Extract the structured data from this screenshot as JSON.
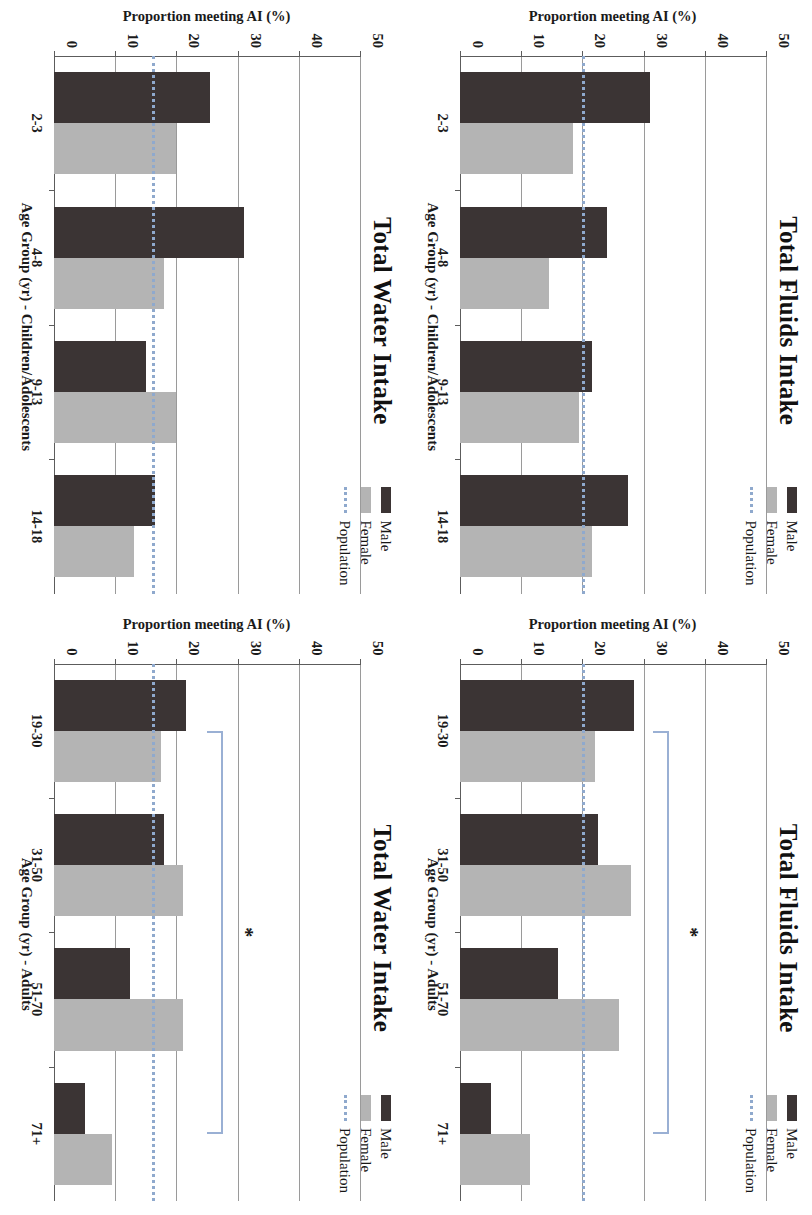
{
  "figure": {
    "orientation": "rotated-90-clockwise",
    "colors": {
      "male": "#3b3434",
      "female": "#b4b4b4",
      "population_line": "#8fa9cd",
      "bracket": "#9ab0d4",
      "gridline": "#9a9a9a",
      "axis": "#5c5c5c"
    },
    "legend": {
      "male_label": "Male",
      "female_label": "Female",
      "population_label": "Population"
    },
    "y_axis": {
      "label": "Proportion meeting AI (%)",
      "ticks": [
        "0",
        "10",
        "20",
        "30",
        "40",
        "50"
      ],
      "min": 0,
      "max": 50
    },
    "significance_marker": "*"
  },
  "panels": [
    {
      "id": "total-fluids-children",
      "title": "Total Fluids Intake",
      "xlabel": "Age Group (yr) - Children/Adolescents",
      "has_significance": false
    },
    {
      "id": "total-fluids-adults",
      "title": "Total Fluids Intake",
      "xlabel": "Age Group (yr) - Adults",
      "has_significance": true
    },
    {
      "id": "total-water-children",
      "title": "Total Water Intake",
      "xlabel": "Age Group (yr) - Children/Adolescents",
      "has_significance": false
    },
    {
      "id": "total-water-adults",
      "title": "Total Water Intake",
      "xlabel": "Age Group (yr) - Adults",
      "has_significance": true
    }
  ],
  "chart_data": [
    {
      "type": "bar",
      "id": "total-fluids-children",
      "title": "Total Fluids Intake",
      "xlabel": "Age Group (yr) - Children/Adolescents",
      "ylabel": "Proportion meeting AI (%)",
      "ylim": [
        0,
        50
      ],
      "yticks": [
        0,
        10,
        20,
        30,
        40,
        50
      ],
      "grid": true,
      "legend_position": "top-right",
      "categories": [
        "2-3",
        "4-8",
        "9-13",
        "14-18"
      ],
      "series": [
        {
          "name": "Male",
          "values": [
            31.0,
            24.0,
            21.5,
            27.5
          ]
        },
        {
          "name": "Female",
          "values": [
            18.5,
            14.5,
            19.5,
            21.5
          ]
        }
      ],
      "reference_line": {
        "name": "Population",
        "value": 20.0,
        "style": "dotted"
      }
    },
    {
      "type": "bar",
      "id": "total-fluids-adults",
      "title": "Total Fluids Intake",
      "xlabel": "Age Group (yr) - Adults",
      "ylabel": "Proportion meeting AI (%)",
      "ylim": [
        0,
        50
      ],
      "yticks": [
        0,
        10,
        20,
        30,
        40,
        50
      ],
      "grid": true,
      "legend_position": "top-right",
      "categories": [
        "19-30",
        "31-50",
        "51-70",
        "71+"
      ],
      "series": [
        {
          "name": "Male",
          "values": [
            28.5,
            22.5,
            16.0,
            5.0
          ]
        },
        {
          "name": "Female",
          "values": [
            22.0,
            28.0,
            26.0,
            11.5
          ]
        }
      ],
      "reference_line": {
        "name": "Population",
        "value": 20.0,
        "style": "dotted"
      },
      "annotations": [
        {
          "type": "significance-bracket",
          "label": "*",
          "from": "19-30",
          "to": "71+",
          "level": 31.5
        }
      ]
    },
    {
      "type": "bar",
      "id": "total-water-children",
      "title": "Total Water Intake",
      "xlabel": "Age Group (yr) - Children/Adolescents",
      "ylabel": "Proportion meeting AI (%)",
      "ylim": [
        0,
        50
      ],
      "yticks": [
        0,
        10,
        20,
        30,
        40,
        50
      ],
      "grid": true,
      "legend_position": "top-right",
      "categories": [
        "2-3",
        "4-8",
        "9-13",
        "14-18"
      ],
      "series": [
        {
          "name": "Male",
          "values": [
            25.5,
            31.0,
            15.0,
            16.5
          ]
        },
        {
          "name": "Female",
          "values": [
            20.0,
            18.0,
            20.0,
            13.0
          ]
        }
      ],
      "reference_line": {
        "name": "Population",
        "value": 16.0,
        "style": "dotted"
      }
    },
    {
      "type": "bar",
      "id": "total-water-adults",
      "title": "Total Water Intake",
      "xlabel": "Age Group (yr) - Adults",
      "ylabel": "Proportion meeting AI (%)",
      "ylim": [
        0,
        50
      ],
      "yticks": [
        0,
        10,
        20,
        30,
        40,
        50
      ],
      "grid": true,
      "legend_position": "top-right",
      "categories": [
        "19-30",
        "31-50",
        "51-70",
        "71+"
      ],
      "series": [
        {
          "name": "Male",
          "values": [
            21.5,
            18.0,
            12.5,
            5.0
          ]
        },
        {
          "name": "Female",
          "values": [
            17.5,
            21.0,
            21.0,
            9.5
          ]
        }
      ],
      "reference_line": {
        "name": "Population",
        "value": 16.0,
        "style": "dotted"
      },
      "annotations": [
        {
          "type": "significance-bracket",
          "label": "*",
          "from": "19-30",
          "to": "71+",
          "level": 25.0
        }
      ]
    }
  ]
}
